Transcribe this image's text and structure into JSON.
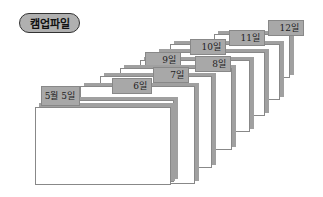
{
  "badge": {
    "label": "캠업파일"
  },
  "tabs": [
    {
      "label": "12일"
    },
    {
      "label": "11일"
    },
    {
      "label": "10일"
    },
    {
      "label": "9일"
    },
    {
      "label": "8일"
    },
    {
      "label": "7일"
    },
    {
      "label": "6일"
    },
    {
      "label": "5월 5일"
    }
  ]
}
